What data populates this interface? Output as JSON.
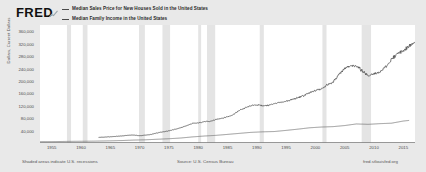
{
  "brand": {
    "logo_text": "FRED",
    "logo_mark": "line-chart-icon"
  },
  "legend": {
    "items": [
      {
        "label": "Median Sales Price for New Houses Sold in the United States",
        "color": "#4a4a4a",
        "swatch": "line-swatch-icon"
      },
      {
        "label": "Median Family Income in the United States",
        "color": "#4a4a4a",
        "swatch": "line-swatch-icon"
      }
    ]
  },
  "footer": {
    "recessions_note": "Shaded areas indicate U.S. recessions",
    "source": "Source: U.S. Census Bureau",
    "url": "fred.stlouisfed.org"
  },
  "chart_data": {
    "type": "line",
    "title": "",
    "xlabel": "",
    "ylabel": "Dollars, Current Dollars",
    "xlim": [
      1953,
      2017
    ],
    "ylim": [
      0,
      380000
    ],
    "grid": false,
    "legend_position": "top",
    "y_ticks": [
      40000,
      80000,
      120000,
      160000,
      200000,
      240000,
      280000,
      320000,
      360000
    ],
    "y_tick_labels": [
      "40,000",
      "80,000",
      "120,000",
      "160,000",
      "200,000",
      "240,000",
      "280,000",
      "320,000",
      "360,000"
    ],
    "x_ticks": [
      1955,
      1960,
      1965,
      1970,
      1975,
      1980,
      1985,
      1990,
      1995,
      2000,
      2005,
      2010,
      2015
    ],
    "x_tick_labels": [
      "1955",
      "1960",
      "1965",
      "1970",
      "1975",
      "1980",
      "1985",
      "1990",
      "1995",
      "2000",
      "2005",
      "2010",
      "2015"
    ],
    "recession_bands": [
      [
        1957.6,
        1958.3
      ],
      [
        1960.3,
        1961.1
      ],
      [
        1969.9,
        1970.9
      ],
      [
        1973.9,
        1975.2
      ],
      [
        1980.0,
        1980.5
      ],
      [
        1981.5,
        1982.9
      ],
      [
        1990.5,
        1991.2
      ],
      [
        2001.2,
        2001.9
      ],
      [
        2007.9,
        2009.5
      ]
    ],
    "recession_color": "#e4e4e4",
    "series": [
      {
        "name": "Median Sales Price for New Houses Sold in the United States",
        "color": "#4a4a4a",
        "x": [
          1963.0,
          1964.0,
          1965.0,
          1966.0,
          1967.0,
          1968.0,
          1969.0,
          1970.0,
          1971.0,
          1972.0,
          1973.0,
          1974.0,
          1975.0,
          1976.0,
          1977.0,
          1978.0,
          1979.0,
          1980.0,
          1981.0,
          1982.0,
          1983.0,
          1984.0,
          1985.0,
          1986.0,
          1987.0,
          1988.0,
          1989.0,
          1990.0,
          1991.0,
          1992.0,
          1993.0,
          1994.0,
          1995.0,
          1996.0,
          1997.0,
          1998.0,
          1999.0,
          2000.0,
          2001.0,
          2002.0,
          2003.0,
          2004.0,
          2005.0,
          2006.0,
          2007.0,
          2008.0,
          2009.0,
          2010.0,
          2011.0,
          2012.0,
          2013.0,
          2014.0,
          2015.0,
          2016.0,
          2017.0
        ],
        "values": [
          18000,
          18900,
          20000,
          21400,
          22700,
          24700,
          25600,
          23400,
          25200,
          27600,
          32500,
          35900,
          39300,
          44200,
          48800,
          55700,
          62900,
          64600,
          68900,
          69300,
          75300,
          79900,
          84300,
          92000,
          104500,
          112500,
          120000,
          122900,
          120000,
          121500,
          126500,
          130000,
          133900,
          140000,
          146000,
          152500,
          161000,
          169000,
          175200,
          187600,
          195000,
          221000,
          240900,
          246500,
          247900,
          232100,
          216700,
          221800,
          227200,
          245200,
          268900,
          288500,
          296400,
          313100,
          323100
        ]
      },
      {
        "name": "Median Family Income in the United States",
        "color": "#6b6b6b",
        "x": [
          1953.0,
          1955.0,
          1957.0,
          1959.0,
          1961.0,
          1963.0,
          1965.0,
          1967.0,
          1969.0,
          1971.0,
          1973.0,
          1975.0,
          1977.0,
          1979.0,
          1981.0,
          1983.0,
          1985.0,
          1987.0,
          1989.0,
          1991.0,
          1993.0,
          1995.0,
          1997.0,
          1999.0,
          2001.0,
          2003.0,
          2005.0,
          2007.0,
          2009.0,
          2011.0,
          2013.0,
          2015.0,
          2016.0
        ],
        "values": [
          4233,
          4421,
          4971,
          5417,
          5735,
          6249,
          6957,
          7933,
          9433,
          10285,
          12051,
          13719,
          16009,
          19587,
          22388,
          24580,
          27735,
          30970,
          34213,
          35939,
          36959,
          40611,
          44568,
          48950,
          51407,
          52680,
          56194,
          61355,
          60088,
          62273,
          63815,
          70697,
          72707
        ]
      }
    ]
  }
}
